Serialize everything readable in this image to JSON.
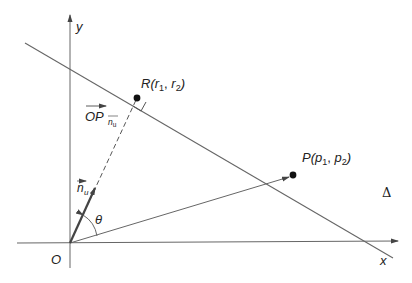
{
  "diagram": {
    "axes": {
      "x_label": "x",
      "y_label": "y",
      "origin_label": "O"
    },
    "line_label": "Δ",
    "points": {
      "R": {
        "name": "R",
        "open": "(",
        "c1": "r",
        "s1": "1",
        "sep": ", ",
        "c2": "r",
        "s2": "2",
        "close": ")"
      },
      "P": {
        "name": "P",
        "open": "(",
        "c1": "p",
        "s1": "1",
        "sep": ", ",
        "c2": "p",
        "s2": "2",
        "close": ")"
      }
    },
    "vectors": {
      "projection_label": "OP",
      "projection_sub": "n",
      "projection_sub2": "u",
      "unit_normal": "n",
      "unit_normal_sub": "u"
    },
    "angle_label": "θ",
    "colors": {
      "stroke": "#555555",
      "point": "#111111"
    }
  }
}
